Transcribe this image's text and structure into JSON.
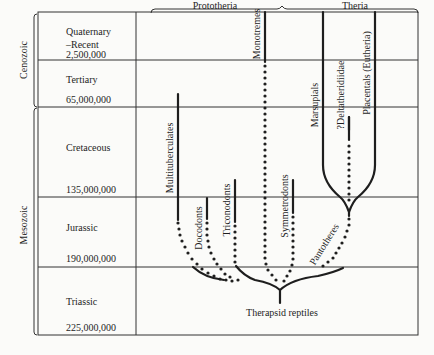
{
  "groups": {
    "prototheria": "Prototheria",
    "theria": "Theria"
  },
  "eras": {
    "cenozoic": "Cenozoic",
    "mesozoic": "Mesozoic"
  },
  "periods": [
    {
      "name": "Quaternary",
      "name2": "–Recent",
      "age": "2,500,000"
    },
    {
      "name": "Tertiary",
      "age": "65,000,000"
    },
    {
      "name": "Cretaceous",
      "age": "135,000,000"
    },
    {
      "name": "Jurassic",
      "age": "190,000,000"
    },
    {
      "name": "Triassic",
      "age": "225,000,000"
    }
  ],
  "lineages": {
    "multituberculates": "Multituberculates",
    "docodonts": "Docodonts",
    "triconodonts": "Triconodonts",
    "monotremes": "Monotremes",
    "symmetrodonts": "Symmetrodonts",
    "pantotheres": "Pantotheres",
    "marsupials": "Marsupials",
    "deltatheridiidae": "?Deltatheridiidae",
    "placentals": "Placentals (Eutheria)"
  },
  "root": "Therapsid reptiles"
}
